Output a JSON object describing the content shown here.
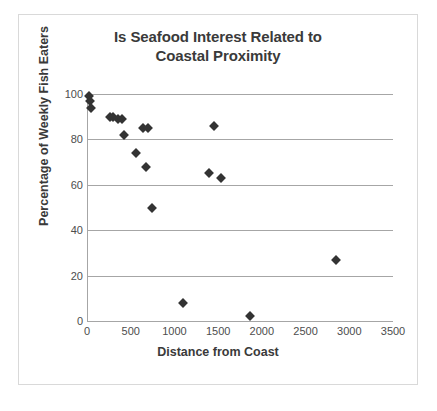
{
  "chart_data": {
    "type": "scatter",
    "title": "Is Seafood Interest Related to Coastal Proximity",
    "title_lines": [
      "Is Seafood Interest Related to",
      "Coastal Proximity"
    ],
    "xlabel": "Distance from Coast",
    "ylabel": "Percentage of Weekly Fish Eaters",
    "xlim": [
      0,
      3500
    ],
    "ylim": [
      0,
      100
    ],
    "xticks": [
      0,
      500,
      1000,
      1500,
      2000,
      2500,
      3000,
      3500
    ],
    "yticks": [
      0,
      20,
      40,
      60,
      80,
      100
    ],
    "grid": "horizontal",
    "legend": "none",
    "marker": "diamond",
    "marker_color": "#333333",
    "points": [
      {
        "x": 20,
        "y": 99
      },
      {
        "x": 35,
        "y": 97
      },
      {
        "x": 45,
        "y": 94
      },
      {
        "x": 265,
        "y": 90
      },
      {
        "x": 300,
        "y": 90
      },
      {
        "x": 360,
        "y": 89
      },
      {
        "x": 395,
        "y": 89
      },
      {
        "x": 425,
        "y": 82
      },
      {
        "x": 560,
        "y": 74
      },
      {
        "x": 645,
        "y": 85
      },
      {
        "x": 700,
        "y": 85
      },
      {
        "x": 680,
        "y": 68
      },
      {
        "x": 740,
        "y": 50
      },
      {
        "x": 1100,
        "y": 8
      },
      {
        "x": 1450,
        "y": 86
      },
      {
        "x": 1400,
        "y": 65
      },
      {
        "x": 1530,
        "y": 63
      },
      {
        "x": 1870,
        "y": 2
      },
      {
        "x": 2850,
        "y": 27
      }
    ]
  },
  "colors": {
    "title": "#3a3a3a",
    "axis": "#a6a6a6",
    "tick_text": "#4d4d4d",
    "marker": "#333333",
    "card_border": "#d9d9d9",
    "background": "#ffffff"
  }
}
